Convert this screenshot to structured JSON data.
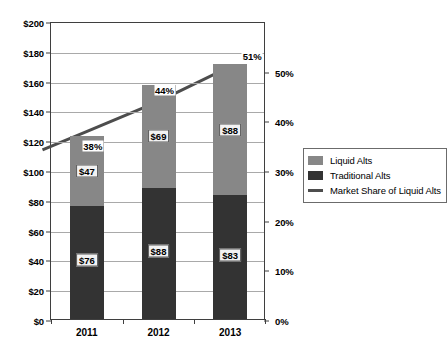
{
  "chart_data": {
    "type": "bar",
    "title": "",
    "subtitle": "",
    "xlabel": "",
    "ylabel": "",
    "categories": [
      "2011",
      "2012",
      "2013"
    ],
    "series": [
      {
        "name": "Traditional Alts",
        "type": "bar",
        "axis": "left",
        "color": "#333333",
        "values": [
          76,
          88,
          83
        ],
        "labels": [
          "$76",
          "$88",
          "$83"
        ]
      },
      {
        "name": "Liquid Alts",
        "type": "bar",
        "axis": "left",
        "color": "#878787",
        "values": [
          47,
          69,
          88
        ],
        "labels": [
          "$47",
          "$69",
          "$88"
        ]
      },
      {
        "name": "Market Share of Liquid Alts",
        "type": "line",
        "axis": "right",
        "color": "#4d4d4d",
        "values": [
          38,
          44,
          51
        ],
        "labels": [
          "38%",
          "44%",
          "51%"
        ]
      }
    ],
    "stacked": true,
    "grid": true,
    "legend_position": "right",
    "left_axis": {
      "min": 0,
      "max": 200,
      "step": 20,
      "ticks": [
        "$0",
        "$20",
        "$40",
        "$60",
        "$80",
        "$100",
        "$120",
        "$140",
        "$160",
        "$180",
        "$200"
      ]
    },
    "right_axis": {
      "min": 0,
      "max": 60,
      "step": 10,
      "ticks": [
        "0%",
        "10%",
        "20%",
        "30%",
        "40%",
        "50%"
      ]
    }
  },
  "legend": {
    "items": [
      {
        "label": "Liquid Alts",
        "marker": "square",
        "color": "#878787"
      },
      {
        "label": "Traditional Alts",
        "marker": "square",
        "color": "#333333"
      },
      {
        "label": "Market Share of Liquid Alts",
        "marker": "line",
        "color": "#4d4d4d"
      }
    ]
  }
}
